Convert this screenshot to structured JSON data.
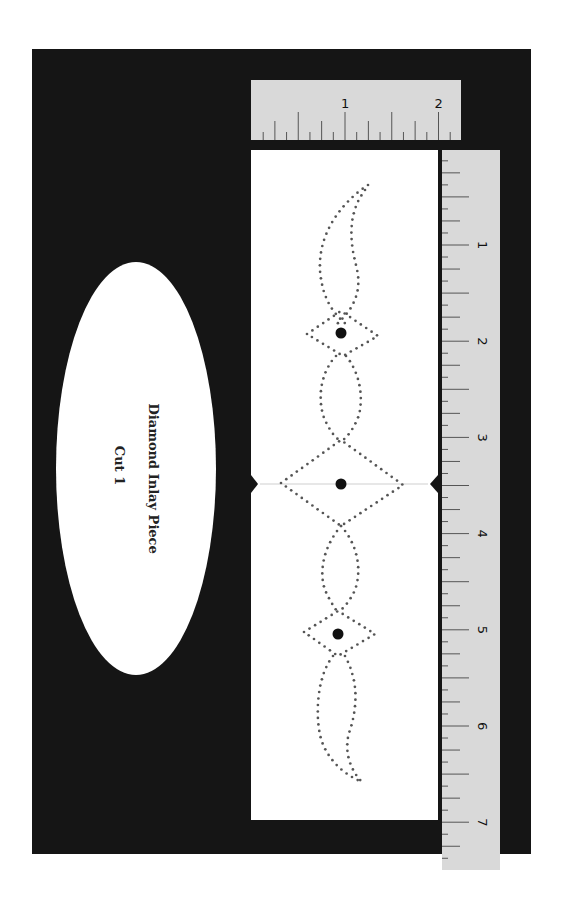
{
  "pattern": {
    "title": "Diamond Inlay Piece",
    "subtitle": "Cut 1"
  },
  "ruler_top": {
    "orientation": "horizontal",
    "unit": "inch",
    "labels": [
      "1",
      "2"
    ],
    "subdivisions": 8
  },
  "ruler_vertical": {
    "orientation": "vertical",
    "unit": "inch",
    "labels": [
      "1",
      "2",
      "3",
      "4",
      "5",
      "6",
      "7"
    ],
    "subdivisions": 8
  },
  "colors": {
    "backdrop": "#151515",
    "ruler": "#d9d9d9",
    "paper": "#ffffff",
    "dots": "#555555",
    "hole": "#111111"
  }
}
